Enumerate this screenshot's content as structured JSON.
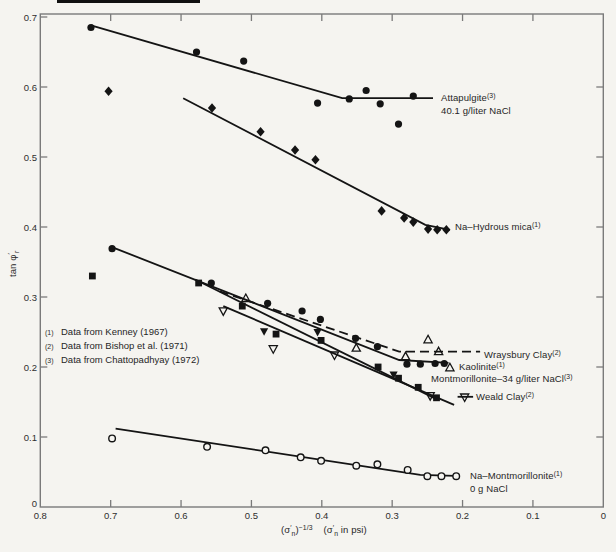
{
  "figure": {
    "background": "#f5f4f0",
    "ink_color": "#141414",
    "frame_color": "#7a7a7a",
    "text_color": "#262626"
  },
  "chart_data": {
    "type": "scatter",
    "title": "",
    "xlabel": "(σ′n)^-1/3  (σ′n in psi)",
    "ylabel": "tan φ′r",
    "xlim": [
      0.8,
      0.0
    ],
    "ylim": [
      0,
      0.7
    ],
    "x_axis_reversed": true,
    "grid": false,
    "frame": "full-box-with-inward-ticks",
    "axes": {
      "x": {
        "ticks": [
          0.8,
          0.7,
          0.6,
          0.5,
          0.4,
          0.3,
          0.2,
          0.1,
          0
        ],
        "tick_labels": [
          "0.8",
          "0.7",
          "0.6",
          "0.5",
          "0.4",
          "0.3",
          "0.2",
          "0.1",
          "0"
        ],
        "title_segments": [
          {
            "t": "("
          },
          {
            "t": "σ"
          },
          {
            "t": "′",
            "v": "sup"
          },
          {
            "t": "n",
            "v": "sub"
          },
          {
            "t": ")"
          },
          {
            "t": "−1/3",
            "v": "sup"
          },
          {
            "t": "    "
          },
          {
            "t": "("
          },
          {
            "t": "σ"
          },
          {
            "t": "′",
            "v": "sup"
          },
          {
            "t": "n",
            "v": "sub"
          },
          {
            "t": " in psi)"
          }
        ]
      },
      "y": {
        "ticks": [
          0,
          0.1,
          0.2,
          0.3,
          0.4,
          0.5,
          0.6,
          0.7
        ],
        "tick_labels": [
          "0",
          "0.1",
          "0.2",
          "0.3",
          "0.4",
          "0.5",
          "0.6",
          "0.7"
        ],
        "title_segments": [
          {
            "t": "tan φ"
          },
          {
            "t": "′",
            "v": "sup"
          },
          {
            "t": "r",
            "v": "sub"
          }
        ]
      }
    },
    "footnotes": {
      "pos": [
        45,
        321
      ],
      "items": [
        {
          "ref": "(1)",
          "text": "Data from Kenney (1967)"
        },
        {
          "ref": "(2)",
          "text": "Data from Bishop et al. (1971)"
        },
        {
          "ref": "(3)",
          "text": "Data from Chattopadhyay (1972)"
        }
      ]
    },
    "series": [
      {
        "name": "attapulgite",
        "display_name": "Attapulgite (3), 40.1 g/liter NaCl",
        "footnote_ref": "(3)",
        "marker_shape": "filled-circle",
        "line_style": "solid",
        "lines": [
          [
            [
              0.728,
              0.688
            ],
            [
              0.371,
              0.584
            ],
            [
              0.242,
              0.584
            ]
          ]
        ],
        "markers": [
          {
            "type": "filled-circle",
            "points": [
              [
                0.728,
                0.685
              ],
              [
                0.578,
                0.65
              ],
              [
                0.511,
                0.637
              ],
              [
                0.406,
                0.577
              ],
              [
                0.361,
                0.583
              ],
              [
                0.337,
                0.595
              ],
              [
                0.317,
                0.576
              ],
              [
                0.291,
                0.547
              ],
              [
                0.27,
                0.587
              ]
            ]
          }
        ],
        "label_pos": [
          441,
          92
        ],
        "label_lines": [
          [
            {
              "t": "Attapulgite"
            },
            {
              "t": "(3)",
              "v": "sup"
            }
          ],
          [
            {
              "t": "40.1 g/liter NaCl"
            }
          ]
        ]
      },
      {
        "name": "na-hydrous-mica",
        "display_name": "Na-Hydrous mica (1)",
        "footnote_ref": "(1)",
        "marker_shape": "filled-diamond",
        "line_style": "solid",
        "lines": [
          [
            [
              0.597,
              0.584
            ],
            [
              0.253,
              0.403
            ],
            [
              0.218,
              0.396
            ]
          ]
        ],
        "markers": [
          {
            "type": "filled-diamond",
            "points": [
              [
                0.703,
                0.594
              ],
              [
                0.556,
                0.57
              ],
              [
                0.487,
                0.536
              ],
              [
                0.438,
                0.51
              ],
              [
                0.409,
                0.496
              ],
              [
                0.315,
                0.423
              ],
              [
                0.283,
                0.413
              ],
              [
                0.27,
                0.407
              ],
              [
                0.249,
                0.397
              ],
              [
                0.236,
                0.396
              ],
              [
                0.223,
                0.396
              ]
            ]
          }
        ],
        "label_pos": [
          455,
          221
        ],
        "label_lines": [
          [
            {
              "t": "Na–Hydrous mica"
            },
            {
              "t": "(1)",
              "v": "sup"
            }
          ]
        ]
      },
      {
        "name": "kaolinite",
        "display_name": "Kaolinite (1)",
        "footnote_ref": "(1)",
        "marker_shape": "filled-circle",
        "line_style": "solid",
        "lines": [
          [
            [
              0.7,
              0.372
            ],
            [
              0.29,
              0.21
            ],
            [
              0.22,
              0.206
            ]
          ]
        ],
        "markers": [
          {
            "type": "filled-circle",
            "points": [
              [
                0.698,
                0.369
              ],
              [
                0.557,
                0.32
              ],
              [
                0.477,
                0.291
              ],
              [
                0.428,
                0.28
              ],
              [
                0.402,
                0.268
              ],
              [
                0.352,
                0.241
              ],
              [
                0.321,
                0.229
              ],
              [
                0.279,
                0.204
              ],
              [
                0.26,
                0.204
              ],
              [
                0.239,
                0.205
              ],
              [
                0.226,
                0.205
              ]
            ]
          }
        ],
        "label_pos": [
          459,
          361
        ],
        "label_lines": [
          [
            {
              "t": "Kaolinite"
            },
            {
              "t": "(1)",
              "v": "sup"
            }
          ]
        ]
      },
      {
        "name": "wraysbury-clay",
        "display_name": "Wraysbury Clay (2)",
        "footnote_ref": "(2)",
        "marker_shape": "open-triangle-up",
        "line_style": "dashed",
        "lines": [
          [
            [
              0.545,
              0.308
            ],
            [
              0.29,
              0.222
            ],
            [
              0.175,
              0.222
            ]
          ]
        ],
        "markers": [
          {
            "type": "open-triangle-up",
            "points": [
              [
                0.508,
                0.298
              ],
              [
                0.351,
                0.227
              ],
              [
                0.281,
                0.215
              ],
              [
                0.249,
                0.239
              ],
              [
                0.234,
                0.222
              ],
              [
                0.218,
                0.199
              ]
            ]
          }
        ],
        "label_pos": [
          484,
          349
        ],
        "label_lines": [
          [
            {
              "t": "Wraysbury Clay"
            },
            {
              "t": "(2)",
              "v": "sup"
            }
          ]
        ]
      },
      {
        "name": "montmorillonite-34",
        "display_name": "Montmorillonite-34 g/liter NaCl (3)",
        "footnote_ref": "(3)",
        "marker_shape": "filled-square",
        "line_style": "solid",
        "lines": [
          [
            [
              0.58,
              0.325
            ],
            [
              0.235,
              0.153
            ]
          ]
        ],
        "markers": [
          {
            "type": "filled-square",
            "points": [
              [
                0.726,
                0.33
              ],
              [
                0.575,
                0.32
              ],
              [
                0.513,
                0.287
              ],
              [
                0.465,
                0.247
              ],
              [
                0.401,
                0.238
              ],
              [
                0.32,
                0.2
              ],
              [
                0.291,
                0.184
              ],
              [
                0.263,
                0.171
              ],
              [
                0.237,
                0.156
              ]
            ]
          }
        ],
        "label_pos": [
          431,
          373
        ],
        "label_lines": [
          [
            {
              "t": "Montmorillonite–34 g/liter NaCl"
            },
            {
              "t": "(3)",
              "v": "sup"
            }
          ]
        ]
      },
      {
        "name": "weald-clay",
        "display_name": "Weald Clay (2)",
        "footnote_ref": "(2)",
        "marker_shape": "triangle-down",
        "line_style": "solid",
        "lines": [
          [
            [
              0.54,
              0.287
            ],
            [
              0.212,
              0.146
            ]
          ],
          [
            [
              0.207,
              0.1575
            ],
            [
              0.185,
              0.1575
            ]
          ]
        ],
        "markers": [
          {
            "type": "filled-triangle-down",
            "points": [
              [
                0.482,
                0.251
              ],
              [
                0.406,
                0.25
              ],
              [
                0.298,
                0.189
              ]
            ]
          },
          {
            "type": "open-triangle-down",
            "points": [
              [
                0.54,
                0.28
              ],
              [
                0.469,
                0.226
              ],
              [
                0.382,
                0.217
              ],
              [
                0.246,
                0.159
              ],
              [
                0.197,
                0.157
              ]
            ]
          }
        ],
        "label_pos": [
          476,
          391
        ],
        "label_lines": [
          [
            {
              "t": "Weald Clay"
            },
            {
              "t": "(2)",
              "v": "sup"
            }
          ]
        ]
      },
      {
        "name": "na-montmorillonite",
        "display_name": "Na-Montmorillonite (1), 0 g NaCl",
        "footnote_ref": "(1)",
        "marker_shape": "open-circle",
        "line_style": "solid",
        "lines": [
          [
            [
              0.693,
              0.112
            ],
            [
              0.26,
              0.046
            ],
            [
              0.21,
              0.0445
            ]
          ]
        ],
        "markers": [
          {
            "type": "open-circle",
            "points": [
              [
                0.698,
                0.098
              ],
              [
                0.563,
                0.086
              ],
              [
                0.48,
                0.081
              ],
              [
                0.43,
                0.071
              ],
              [
                0.401,
                0.066
              ],
              [
                0.351,
                0.059
              ],
              [
                0.321,
                0.061
              ],
              [
                0.278,
                0.053
              ],
              [
                0.25,
                0.044
              ],
              [
                0.23,
                0.044
              ],
              [
                0.209,
                0.044
              ]
            ]
          }
        ],
        "label_pos": [
          470,
          470
        ],
        "label_lines": [
          [
            {
              "t": "Na–Montmorillonite"
            },
            {
              "t": "(1)",
              "v": "sup"
            }
          ],
          [
            {
              "t": "0 g NaCl"
            }
          ]
        ]
      }
    ]
  }
}
